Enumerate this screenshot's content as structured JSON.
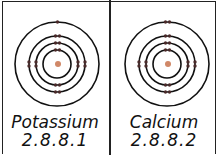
{
  "atoms": [
    {
      "name": "Potassium",
      "configuration": "2.8.8.1",
      "shells": [
        2,
        8,
        8,
        1
      ]
    },
    {
      "name": "Calcium",
      "configuration": "2.8.8.2",
      "shells": [
        2,
        8,
        8,
        2
      ]
    }
  ],
  "colors": {
    "nucleus": "#d08868",
    "electron": "#4a2a2a",
    "orbit": "#111111"
  }
}
